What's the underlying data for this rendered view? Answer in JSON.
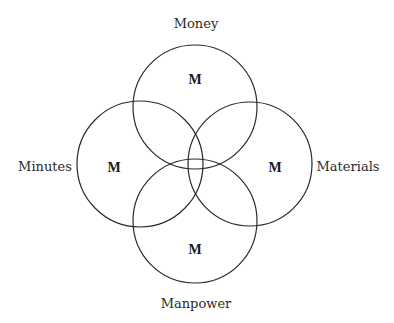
{
  "diagram": {
    "type": "four-circle-venn",
    "circles": [
      {
        "id": "money",
        "label": "Money",
        "center_letter": "M",
        "cx": 195,
        "cy": 107,
        "r": 62
      },
      {
        "id": "minutes",
        "label": "Minutes",
        "center_letter": "M",
        "cx": 140,
        "cy": 164,
        "r": 63
      },
      {
        "id": "materials",
        "label": "Materials",
        "center_letter": "M",
        "cx": 250,
        "cy": 164,
        "r": 62
      },
      {
        "id": "manpower",
        "label": "Manpower",
        "center_letter": "M",
        "cx": 195,
        "cy": 221,
        "r": 62
      }
    ],
    "stroke_color": "#2a2a2a",
    "background": "#ffffff"
  }
}
